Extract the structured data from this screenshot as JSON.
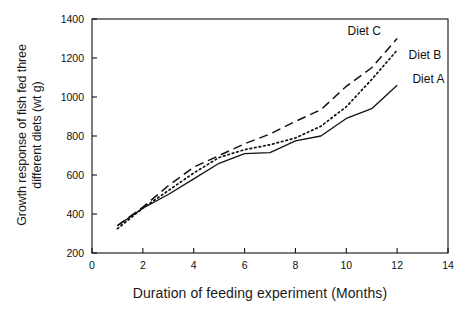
{
  "chart_data": {
    "type": "line",
    "title": "",
    "subtitle": "",
    "xlabel": "Duration of feeding experiment (Months)",
    "ylabel_line1": "Growth response of fish fed three",
    "ylabel_line2": "different diets (wt g)",
    "ylabel": "Growth response of fish fed three different diets (wt g)",
    "x": [
      1,
      2,
      3,
      4,
      5,
      6,
      7,
      8,
      9,
      10,
      11,
      12
    ],
    "xlim": [
      0,
      14
    ],
    "ylim": [
      200,
      1400
    ],
    "xticks": [
      0,
      2,
      4,
      6,
      8,
      10,
      12,
      14
    ],
    "xtick_labels": [
      "0",
      "2",
      "4",
      "6",
      "8",
      "10",
      "12",
      "14"
    ],
    "yticks": [
      200,
      400,
      600,
      800,
      1000,
      1200,
      1400
    ],
    "ytick_labels": [
      "200",
      "400",
      "600",
      "800",
      "1000",
      "1200",
      "1400"
    ],
    "grid": false,
    "legend_position": "inline-right-annotations",
    "series": [
      {
        "name": "Diet A",
        "style": "solid",
        "color": "#111111",
        "values": [
          340,
          430,
          500,
          580,
          660,
          710,
          715,
          775,
          800,
          890,
          940,
          1060
        ],
        "label_x": 12.6,
        "label_y": 1090
      },
      {
        "name": "Diet B",
        "style": "dotted",
        "color": "#111111",
        "values": [
          325,
          430,
          520,
          610,
          690,
          730,
          755,
          790,
          850,
          950,
          1090,
          1240
        ],
        "label_x": 12.45,
        "label_y": 1215
      },
      {
        "name": "Diet C",
        "style": "dashed",
        "color": "#111111",
        "values": [
          340,
          435,
          545,
          640,
          700,
          760,
          810,
          875,
          935,
          1055,
          1150,
          1300
        ],
        "label_x": 10.05,
        "label_y": 1340
      }
    ]
  },
  "axes": {
    "frame_color": "#111111",
    "tick_color": "#111111"
  }
}
